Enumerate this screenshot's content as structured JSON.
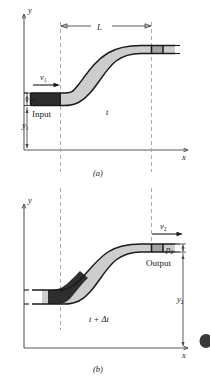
{
  "figure": {
    "type": "physics-diagram"
  },
  "panel_a": {
    "caption": "(a)",
    "axis_x_label": "x",
    "axis_y_label": "y",
    "length_label": "L",
    "velocity_label": "v",
    "velocity_sub": "1",
    "pressure_label": "p",
    "pressure_sub": "1",
    "height_label": "y",
    "height_sub": "1",
    "input_label": "Input",
    "time_label": "t",
    "colors": {
      "fluid_light": "#cdcdcd",
      "fluid_mid": "#a4a4a4",
      "fluid_dark": "#2e2e2e",
      "outline": "#1b1b1b",
      "guide": "#a9a9ac",
      "axis": "#58585a"
    }
  },
  "panel_b": {
    "caption": "(b)",
    "axis_x_label": "x",
    "axis_y_label": "y",
    "velocity_label": "v",
    "velocity_sub": "2",
    "pressure_label": "p",
    "pressure_sub": "2",
    "height_label": "y",
    "height_sub": "2",
    "output_label": "Output",
    "time_label": "t + Δt",
    "colors": {
      "fluid_light": "#cdcdcd",
      "fluid_mid": "#a4a4a4",
      "fluid_dark": "#2e2e2e",
      "outline": "#1b1b1b",
      "guide": "#a9a9ac",
      "axis": "#58585a"
    }
  }
}
